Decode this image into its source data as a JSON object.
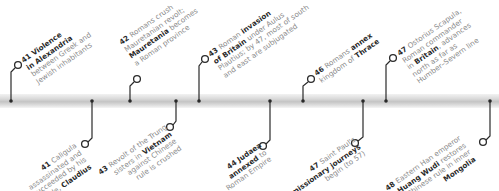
{
  "timeline": {
    "colors": {
      "line": "#2a2a2a",
      "text": "#8a8a8a",
      "emphasis": "#2a2a2a",
      "bar": "#cccccc"
    },
    "events_above": [
      {
        "year": "41",
        "lines": [
          [
            "",
            "Violence"
          ],
          [
            "in Alexandria",
            ""
          ],
          [
            "between Greek and",
            ""
          ],
          [
            "Jewish inhabitants",
            ""
          ]
        ],
        "bold_first_two": true,
        "text": [
          "Violence",
          "in Alexandria",
          "between Greek and",
          "Jewish inhabitants"
        ]
      },
      {
        "year": "42",
        "text": [
          "Romans crush",
          "Mauretanian revolt;",
          "Mauretania",
          "becomes",
          "a Roman province"
        ]
      },
      {
        "year": "43",
        "text": [
          "Roman",
          "invasion",
          "of Britain",
          "under Aulus",
          "Plautius; by 47, most of south",
          "and east are subjugated"
        ]
      },
      {
        "year": "46",
        "text": [
          "Romans",
          "annex",
          "kingdom of",
          "Thrace"
        ]
      },
      {
        "year": "47",
        "text": [
          "Ostorius Scapula,",
          "Roman commander",
          "in",
          "Britain",
          ", advances",
          "north as far as",
          "Humber–Severn line"
        ]
      }
    ],
    "events_below": [
      {
        "year": "41",
        "text": [
          "Caligula",
          "assassinated and",
          "succeeded by his",
          "uncle,",
          "Claudius"
        ]
      },
      {
        "year": "43",
        "text": [
          "Revolt of the Trung",
          "sisters in",
          "Vietnam",
          "against Chinese",
          "rule is crushed"
        ]
      },
      {
        "year": "44",
        "text": [
          "Judaea",
          "annexed",
          "to",
          "Roman Empire"
        ]
      },
      {
        "year": "47",
        "text": [
          "Saint Paul's",
          "missionary journeys",
          "begin (to 57)"
        ]
      },
      {
        "year": "48",
        "text": [
          "Eastern Han emperor",
          "Huang Wudi",
          "restores",
          "Chinese rule in inner",
          "Mongolia"
        ]
      }
    ]
  }
}
